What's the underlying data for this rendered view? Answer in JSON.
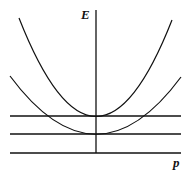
{
  "diagram": {
    "title": "",
    "axes": {
      "y_label": "E",
      "x_label": "p"
    },
    "curves": [
      {
        "type": "parabola",
        "name": "upper-parabola",
        "vertex": [
          96,
          116
        ],
        "left_end": [
          19,
          18
        ],
        "right_end": [
          172,
          20
        ]
      },
      {
        "type": "parabola",
        "name": "lower-parabola",
        "vertex": [
          96,
          134
        ],
        "left_end": [
          10,
          76
        ],
        "right_end": [
          181,
          77
        ]
      }
    ],
    "horizontal_lines_y": [
      116,
      134,
      153
    ],
    "stroke_color": "#111111",
    "background_color": "#ffffff"
  }
}
